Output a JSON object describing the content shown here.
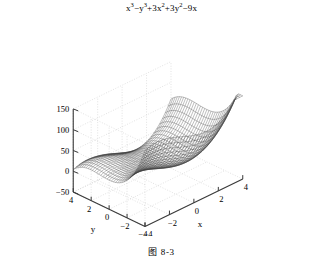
{
  "figure": {
    "caption": "图 8-3",
    "background": "#ffffff"
  },
  "chart_data": {
    "type": "surface",
    "title_plain": "x³−y³+3x²+3y²−9x",
    "title_parts": [
      {
        "t": "x",
        "sup": "3"
      },
      {
        "t": "−"
      },
      {
        "t": "y",
        "sup": "3"
      },
      {
        "t": "+3"
      },
      {
        "t": "x",
        "sup": "2"
      },
      {
        "t": "+3"
      },
      {
        "t": "y",
        "sup": "2"
      },
      {
        "t": "−9"
      },
      {
        "t": "x"
      }
    ],
    "expression": "x^3 - y^3 + 3x^2 + 3y^2 - 9x",
    "xlabel": "x",
    "ylabel": "y",
    "zlabel": "",
    "xlim": [
      -4,
      4
    ],
    "ylim": [
      -4,
      4
    ],
    "zlim": [
      -50,
      150
    ],
    "xticks": [
      -4,
      -2,
      0,
      2,
      4
    ],
    "yticks": [
      -4,
      -2,
      0,
      2,
      4
    ],
    "zticks": [
      -50,
      0,
      50,
      100,
      150
    ],
    "xtick_labels": [
      "−4",
      "−2",
      "0",
      "2",
      "4"
    ],
    "ytick_labels": [
      "4",
      "2",
      "0",
      "−2",
      "−4"
    ],
    "ztick_labels": [
      "−50",
      "0",
      "50",
      "100",
      "150"
    ],
    "grid": true,
    "legend": "none",
    "mesh_color": "#3a3a3a",
    "grid_color": "#cfcfcf",
    "axis_color": "#3a3a3a",
    "samples": 34,
    "view": {
      "azimuth": -60,
      "elevation": 26
    }
  }
}
